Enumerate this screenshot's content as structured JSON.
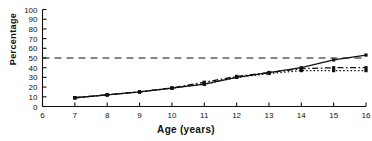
{
  "chart_data": {
    "type": "line",
    "title": "",
    "xlabel": "Age (years)",
    "ylabel": "Percentage",
    "xlim": [
      6,
      16
    ],
    "ylim": [
      0,
      100
    ],
    "xticks": [
      6,
      7,
      8,
      9,
      10,
      11,
      12,
      13,
      14,
      15,
      16
    ],
    "xticklabels": [
      "6",
      "7",
      "8",
      "9",
      "10",
      "11",
      "12",
      "13",
      "14",
      "15",
      "16"
    ],
    "yticks": [
      0,
      10,
      20,
      30,
      40,
      50,
      60,
      70,
      80,
      90,
      100
    ],
    "yticklabels": [
      "0",
      "10",
      "20",
      "30",
      "40",
      "50",
      "60",
      "70",
      "80",
      "90",
      "100"
    ],
    "grid": false,
    "legend": "none",
    "x": [
      7,
      8,
      9,
      10,
      11,
      12,
      13,
      14,
      15,
      16
    ],
    "series": [
      {
        "name": "series-solid",
        "style": "solid",
        "marker": "square",
        "color": "#111111",
        "values": [
          9,
          12,
          15,
          19,
          23,
          30,
          35,
          40,
          48,
          53
        ]
      },
      {
        "name": "series-dash-dot",
        "style": "dash-dot",
        "marker": "square",
        "color": "#111111",
        "values": [
          9,
          12,
          15,
          19,
          25,
          31,
          35,
          39,
          40,
          40
        ]
      },
      {
        "name": "series-dotted",
        "style": "dotted",
        "marker": "square",
        "color": "#111111",
        "values": [
          9,
          12,
          15,
          19,
          23,
          30,
          34,
          37,
          37,
          37
        ]
      }
    ],
    "reference_lines": [
      {
        "name": "fifty-percent-line",
        "orientation": "horizontal",
        "value": 50,
        "style": "dashed",
        "color": "#111111"
      }
    ]
  }
}
